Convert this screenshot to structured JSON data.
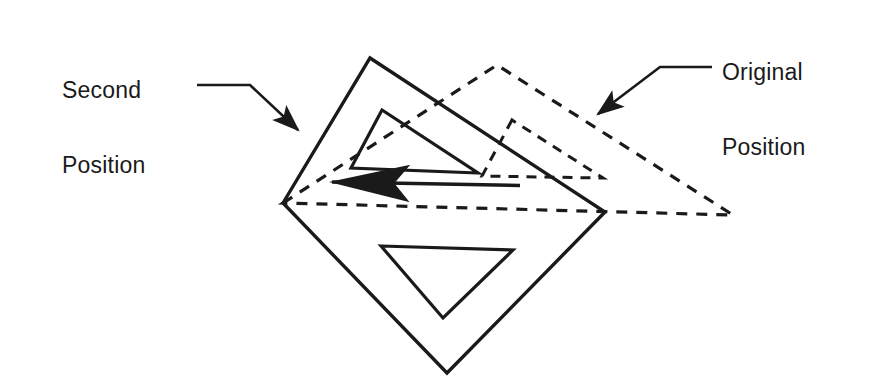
{
  "diagram": {
    "kind": "technical-line-drawing",
    "canvas": {
      "width": 891,
      "height": 389
    },
    "background_color": "#ffffff",
    "ink_color": "#1a1a1a",
    "labels": {
      "second_position": "Second\nPosition",
      "second_position_line1": "Second",
      "second_position_line2": "Position",
      "original_position": "Original\nPosition",
      "original_position_line1": "Original",
      "original_position_line2": "Position"
    },
    "leaders": {
      "second_position": {
        "style": "solid",
        "points": "197,85 250,85 305,137",
        "arrow_at": "305,137",
        "arrow_angle_deg": 43
      },
      "original_position": {
        "style": "solid",
        "points": "712,67 660,67 590,120",
        "arrow_at": "590,120",
        "arrow_angle_deg": 217
      }
    },
    "shapes": {
      "solid_outer_triangle": {
        "name": "second-position-triangle",
        "style": "solid",
        "stroke_width": 3.4,
        "points": "283,203 370,58 605,212 447,373"
      },
      "solid_outer_triangle_note": "large rotated quadrilateral-looking outline formed by triangle plus apex",
      "solid_inner_triangle_upper": {
        "name": "second-position-inner-upper-triangle",
        "style": "solid",
        "stroke_width": 3.2,
        "points": "382,110 351,168 478,173"
      },
      "solid_inner_triangle_lower": {
        "name": "second-position-inner-lower-triangle",
        "style": "solid",
        "stroke_width": 3.2,
        "points": "381,246 513,250 443,318"
      },
      "dashed_outer_triangle": {
        "name": "original-position-triangle",
        "style": "dashed",
        "stroke_width": 3.2,
        "dash": "11 9",
        "points": "283,203 497,65 733,215"
      },
      "dashed_inner_triangle": {
        "name": "original-position-inner-triangle",
        "style": "dashed",
        "stroke_width": 3.0,
        "dash": "10 8",
        "points": "512,120 482,176 603,178"
      },
      "motion_arrow": {
        "name": "rotation-motion-arrow",
        "style": "solid",
        "stroke_width": 3.4,
        "from": "520,185",
        "to": "310,182",
        "direction": "left"
      },
      "dashed_baseline": {
        "name": "original-position-baseline",
        "style": "dashed",
        "from": "605,212",
        "to": "733,215"
      }
    }
  }
}
